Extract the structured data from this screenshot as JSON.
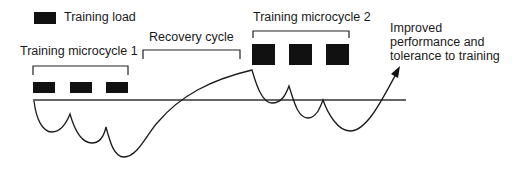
{
  "legend": {
    "label": "Training load",
    "swatch_color": "#111111"
  },
  "labels": {
    "microcycle1": "Training microcycle 1",
    "recovery": "Recovery cycle",
    "microcycle2": "Training microcycle 2",
    "outcome_line1": "Improved",
    "outcome_line2": "performance and",
    "outcome_line3": "tolerance to training"
  },
  "colors": {
    "ink": "#1a1a1a",
    "block": "#111111",
    "background": "#ffffff"
  }
}
